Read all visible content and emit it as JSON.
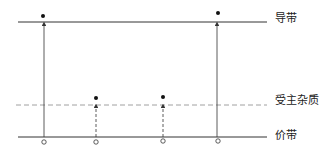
{
  "diagram": {
    "type": "energy-band-diagram",
    "labels": {
      "conduction_band": "导带",
      "acceptor_level": "受主杂质",
      "valence_band": "价带"
    },
    "levels": [
      {
        "name": "conduction_band",
        "y": 22,
        "style": "solid"
      },
      {
        "name": "acceptor_level",
        "y": 105,
        "style": "dashed"
      },
      {
        "name": "valence_band",
        "y": 137,
        "style": "solid"
      }
    ],
    "transitions": [
      {
        "x": 44,
        "from": "valence_band",
        "to": "conduction_band",
        "style": "solid"
      },
      {
        "x": 96,
        "from": "valence_band",
        "to": "acceptor_level",
        "style": "dashed"
      },
      {
        "x": 163,
        "from": "valence_band",
        "to": "acceptor_level",
        "style": "dashed"
      },
      {
        "x": 217,
        "from": "valence_band",
        "to": "conduction_band",
        "style": "solid"
      }
    ],
    "legend": {
      "filled_dot": "electron",
      "open_circle": "hole"
    }
  }
}
